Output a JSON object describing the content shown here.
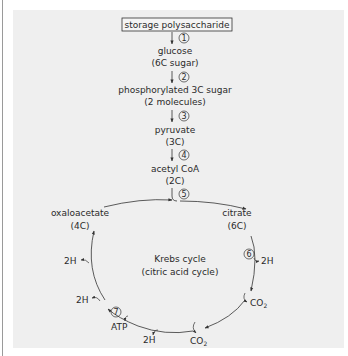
{
  "pathway": {
    "start_box": "storage polysaccharide",
    "steps": [
      {
        "number": "1",
        "symbol": "①"
      },
      {
        "number": "2",
        "symbol": "②"
      },
      {
        "number": "3",
        "symbol": "③"
      },
      {
        "number": "4",
        "symbol": "④"
      },
      {
        "number": "5",
        "symbol": "⑤"
      },
      {
        "number": "6",
        "symbol": "⑥"
      },
      {
        "number": "7",
        "symbol": "⑦"
      }
    ],
    "nodes": {
      "glucose": {
        "name": "glucose",
        "detail": "(6C sugar)"
      },
      "phospho": {
        "name": "phosphorylated 3C sugar",
        "detail": "(2 molecules)"
      },
      "pyruvate": {
        "name": "pyruvate",
        "detail": "(3C)"
      },
      "acetyl": {
        "name": "acetyl CoA",
        "detail": "(2C)"
      },
      "citrate": {
        "name": "citrate",
        "detail": "(6C)"
      },
      "oxaloacetate": {
        "name": "oxaloacetate",
        "detail": "(4C)"
      }
    },
    "cycle": {
      "title": "Krebs cycle",
      "subtitle": "(citric acid cycle)"
    },
    "products": {
      "h2_right": "2H",
      "co2_right": "CO",
      "co2_right_sub": "2",
      "co2_bottom": "CO",
      "co2_bottom_sub": "2",
      "h2_bottom": "2H",
      "atp": "ATP",
      "h2_left_lower": "2H",
      "h2_left_upper": "2H"
    }
  }
}
